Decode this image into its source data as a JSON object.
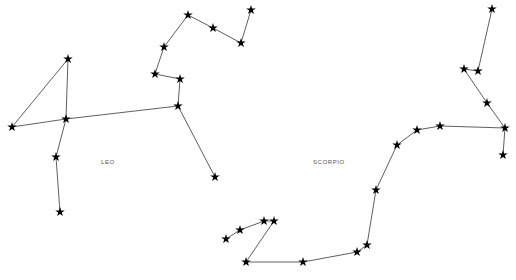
{
  "canvas": {
    "width": 516,
    "height": 280,
    "background": "#ffffff",
    "line_color": "#1a1a1a",
    "star_color": "#000000",
    "label_color": "#555555"
  },
  "diagram": {
    "type": "star-chart",
    "title": "",
    "constellations": [
      {
        "id": "leo",
        "label": "Leo",
        "label_x": 101,
        "label_y": 162,
        "stars": [
          {
            "name": "regulus",
            "x": 66,
            "y": 119
          },
          {
            "name": "denebola",
            "x": 12,
            "y": 127
          },
          {
            "name": "zosma",
            "x": 68,
            "y": 59
          },
          {
            "name": "chertan",
            "x": 56,
            "y": 157
          },
          {
            "name": "iota-leonis",
            "x": 60,
            "y": 212
          },
          {
            "name": "algieba",
            "x": 178,
            "y": 106
          },
          {
            "name": "eta-leonis",
            "x": 180,
            "y": 79
          },
          {
            "name": "sigma-leonis",
            "x": 215,
            "y": 177
          },
          {
            "name": "adhafera",
            "x": 155,
            "y": 74
          },
          {
            "name": "rasalas",
            "x": 164,
            "y": 47
          },
          {
            "name": "algenubi",
            "x": 188,
            "y": 15
          },
          {
            "name": "mu-leonis",
            "x": 213,
            "y": 28
          },
          {
            "name": "epsilon-leo",
            "x": 241,
            "y": 43
          },
          {
            "name": "kappa-leonis",
            "x": 251,
            "y": 10
          }
        ],
        "segments": [
          [
            2,
            0
          ],
          [
            2,
            1
          ],
          [
            1,
            0
          ],
          [
            0,
            3
          ],
          [
            3,
            4
          ],
          [
            0,
            5
          ],
          [
            5,
            6
          ],
          [
            5,
            7
          ],
          [
            6,
            8
          ],
          [
            8,
            9
          ],
          [
            9,
            10
          ],
          [
            10,
            11
          ],
          [
            11,
            12
          ],
          [
            12,
            13
          ]
        ]
      },
      {
        "id": "scorpio",
        "label": "Scorpio",
        "label_x": 313,
        "label_y": 162,
        "stars": [
          {
            "name": "antares",
            "x": 440,
            "y": 126
          },
          {
            "name": "graffias",
            "x": 505,
            "y": 128
          },
          {
            "name": "dschubba",
            "x": 487,
            "y": 103
          },
          {
            "name": "pi-scorpii",
            "x": 478,
            "y": 71
          },
          {
            "name": "rho-scorpii",
            "x": 503,
            "y": 155
          },
          {
            "name": "nu-scorpii",
            "x": 464,
            "y": 69
          },
          {
            "name": "beta-scorpii",
            "x": 492,
            "y": 9
          },
          {
            "name": "sigma-scorpii",
            "x": 417,
            "y": 130
          },
          {
            "name": "tau-scorpii",
            "x": 397,
            "y": 145
          },
          {
            "name": "epsilon-scorpii",
            "x": 376,
            "y": 190
          },
          {
            "name": "mu-scorpii",
            "x": 367,
            "y": 245
          },
          {
            "name": "zeta-scorpii",
            "x": 357,
            "y": 252
          },
          {
            "name": "eta-scorpii",
            "x": 303,
            "y": 262
          },
          {
            "name": "theta-scorpii",
            "x": 246,
            "y": 262
          },
          {
            "name": "iota-scorpii",
            "x": 264,
            "y": 221
          },
          {
            "name": "kappa-scorpii",
            "x": 274,
            "y": 221
          },
          {
            "name": "lesath",
            "x": 240,
            "y": 230
          },
          {
            "name": "shaula",
            "x": 226,
            "y": 239
          }
        ],
        "segments": [
          [
            4,
            1
          ],
          [
            1,
            0
          ],
          [
            1,
            2
          ],
          [
            2,
            5
          ],
          [
            5,
            3
          ],
          [
            3,
            6
          ],
          [
            0,
            7
          ],
          [
            7,
            8
          ],
          [
            8,
            9
          ],
          [
            9,
            10
          ],
          [
            10,
            11
          ],
          [
            11,
            12
          ],
          [
            12,
            13
          ],
          [
            13,
            15
          ],
          [
            15,
            14
          ],
          [
            14,
            16
          ],
          [
            16,
            17
          ]
        ]
      }
    ]
  }
}
